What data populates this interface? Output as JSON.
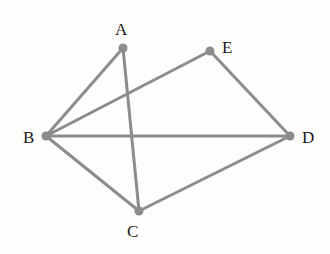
{
  "diagram": {
    "type": "geometry-figure",
    "line_color": "#8c8c8c",
    "point_color": "#8c8c8c",
    "label_color": "#1a1a1a",
    "points": [
      {
        "id": "A",
        "label": "A",
        "x": 123,
        "y": 48,
        "label_x": 115,
        "label_y": 21
      },
      {
        "id": "E",
        "label": "E",
        "x": 210,
        "y": 51,
        "label_x": 222,
        "label_y": 39
      },
      {
        "id": "B",
        "label": "B",
        "x": 46,
        "y": 136,
        "label_x": 23,
        "label_y": 129
      },
      {
        "id": "D",
        "label": "D",
        "x": 290,
        "y": 136,
        "label_x": 302,
        "label_y": 129
      },
      {
        "id": "C",
        "label": "C",
        "x": 139,
        "y": 211,
        "label_x": 127,
        "label_y": 223
      }
    ],
    "segments": [
      [
        "A",
        "B"
      ],
      [
        "A",
        "C"
      ],
      [
        "B",
        "E"
      ],
      [
        "B",
        "D"
      ],
      [
        "B",
        "C"
      ],
      [
        "E",
        "D"
      ],
      [
        "C",
        "D"
      ]
    ]
  }
}
